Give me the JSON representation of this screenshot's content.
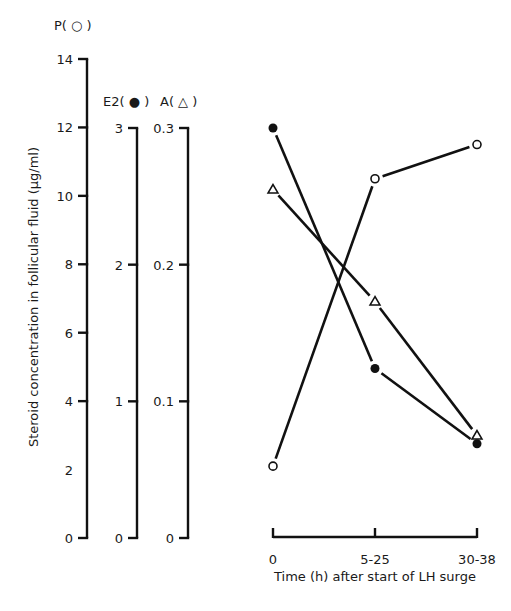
{
  "chart_data": {
    "type": "line",
    "title": "",
    "ylabel": "Steroid concentration in follicular fluid (µg/ml)",
    "xlabel": "Time (h) after start of LH surge",
    "categories": [
      "0",
      "5-25",
      "30-38"
    ],
    "y_axes": [
      {
        "id": "P",
        "title": "P( ○ )",
        "range": [
          0,
          14
        ],
        "ticks": [
          0,
          2,
          4,
          6,
          8,
          10,
          12,
          14
        ],
        "tick_labels": [
          "0",
          "2",
          "4",
          "6",
          "8",
          "10",
          "12",
          "14"
        ],
        "tick_marks": [
          0,
          4,
          6,
          8,
          10,
          12,
          14
        ]
      },
      {
        "id": "E2",
        "title": "E2( ● )",
        "range": [
          0,
          3
        ],
        "ticks": [
          0,
          1,
          2,
          3
        ],
        "tick_labels": [
          "0",
          "1",
          "2",
          "3"
        ]
      },
      {
        "id": "A",
        "title": "A( △ )",
        "range": [
          0,
          0.3
        ],
        "ticks": [
          0,
          0.1,
          0.2,
          0.3
        ],
        "tick_labels": [
          "0",
          "0.1",
          "0.2",
          "0.3"
        ]
      }
    ],
    "series": [
      {
        "name": "P",
        "marker": "open-circle",
        "axis": "P",
        "values": [
          2.1,
          10.5,
          11.5
        ]
      },
      {
        "name": "E2",
        "marker": "filled-circle",
        "axis": "E2",
        "values": [
          3.0,
          1.24,
          0.69
        ]
      },
      {
        "name": "A",
        "marker": "open-triangle",
        "axis": "A",
        "values": [
          0.255,
          0.173,
          0.075
        ]
      }
    ],
    "grid": false,
    "legend": "axis titles"
  }
}
